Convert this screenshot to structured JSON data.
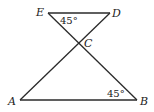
{
  "figure": {
    "points": {
      "E": "E",
      "D": "D",
      "C": "C",
      "A": "A",
      "B": "B"
    },
    "segments": [
      "ED",
      "EB",
      "DA",
      "AB"
    ],
    "angles": {
      "angle_E": "45°",
      "angle_B": "45°"
    }
  }
}
